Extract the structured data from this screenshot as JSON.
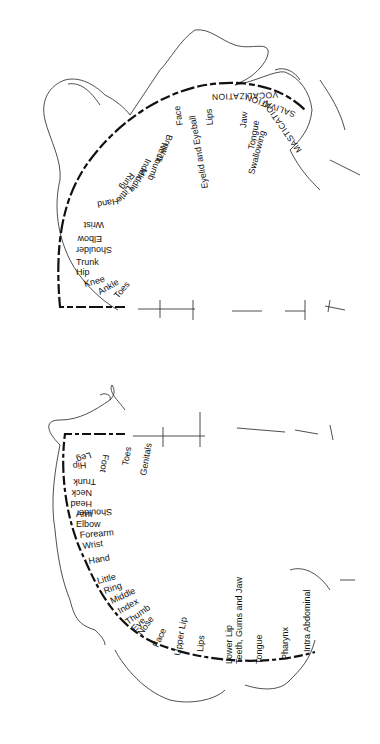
{
  "motor_homunculus": {
    "region": "upper diagram (rotated 90°)",
    "labels": [
      "Toes",
      "Ankle",
      "Knee",
      "Hip",
      "Trunk",
      "Shoulder",
      "Elbow",
      "Wrist",
      "Hand",
      "Little",
      "Ring",
      "Middle",
      "Index",
      "Thumb",
      "Neck",
      "Brow",
      "Eyelid and Eyeball",
      "Face",
      "Lips",
      "Jaw",
      "Tongue",
      "Swallowing"
    ],
    "functions": [
      "VOCALIZATION",
      "SALIVATION",
      "MASTICATION"
    ]
  },
  "sensory_homunculus": {
    "region": "lower diagram (rotated 90°)",
    "labels": [
      "Genitals",
      "Toes",
      "Foot",
      "Leg",
      "Hip",
      "Trunk",
      "Neck",
      "Head",
      "Shoulder",
      "Arm",
      "Elbow",
      "Forearm",
      "Wrist",
      "Hand",
      "Little",
      "Ring",
      "Middle",
      "Index",
      "Thumb",
      "Eye",
      "Nose",
      "Face",
      "Upper Lip",
      "Lips",
      "Lower Lip",
      "Teeth, Gums and Jaw",
      "Tongue",
      "Pharynx",
      "Intra Abdominal"
    ]
  }
}
